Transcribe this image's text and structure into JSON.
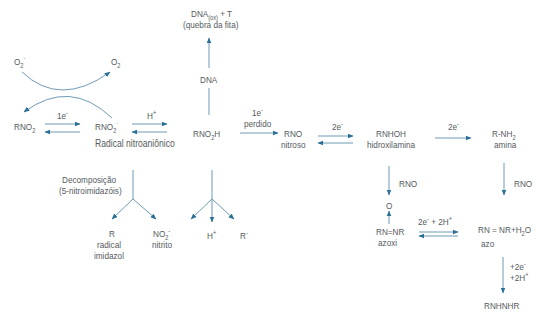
{
  "colors": {
    "arrow": "#2a6f97",
    "arrow_light": "#7fa6bd",
    "text": "#555a5e"
  },
  "species": {
    "o2_radical": "O",
    "o2_radical_sub": "2",
    "o2_radical_sup": "·",
    "o2": "O",
    "o2_sub": "2",
    "rno2": "RNO",
    "rno2_sub": "2",
    "rno2_radical": "RNO",
    "rno2_radical_sub": "2",
    "rno2_radical_sup": "·",
    "radical_label": "Radical nitroaniônico",
    "rno2h": "RNO",
    "rno2h_sub": "2",
    "rno2h_tail": "H",
    "dna": "DNA",
    "dna_ox": "DNA",
    "dna_ox_sub": "(ox)",
    "dna_ox_tail": " + T",
    "dna_break": "(quebra da fita)",
    "rno": "RNO",
    "nitroso": "nitroso",
    "rnhoh": "RNHOH",
    "hidroxilamina": "hidroxilamina",
    "rnh2": "R-NH",
    "rnh2_sub": "2",
    "amina": "amina",
    "oxygen": "O",
    "azoxi_formula": "RN=NR",
    "azoxi": "azoxi",
    "azo_formula_a": "RN = NR+H",
    "azo_formula_sub": "2",
    "azo_formula_b": "O",
    "azo": "azo",
    "rnhnhr": "RNHNHR",
    "decomp_1": "Decomposição",
    "decomp_2": "(5-nitroimidazóis)",
    "r": "R",
    "radical_imidazol_1": "radical",
    "radical_imidazol_2": "imidazol",
    "no2": "NO",
    "no2_sub": "2",
    "no2_sup": "-",
    "nitrito": "nitrito",
    "h_plus": "H",
    "h_plus_sup": "+",
    "r_minus": "R",
    "r_minus_sup": "-"
  },
  "arrow_labels": {
    "one_e": "1e",
    "one_e_sup": "-",
    "h_plus": "H",
    "h_plus_sup": "+",
    "one_e_lost": "1e",
    "one_e_lost_sup": "-",
    "lost": "perdido",
    "two_e_a": "2e",
    "two_e_a_sup": "-",
    "two_e_b": "2e",
    "two_e_b_sup": "-",
    "rno_a": "RNO",
    "rno_b": "RNO",
    "two_e_2h": "2e",
    "two_e_2h_sup": "-",
    "two_e_2h_mid": " + 2H",
    "two_e_2h_sup2": "+",
    "plus2e": "+2e",
    "plus2e_sup": "-",
    "plus2h": "+2H",
    "plus2h_sup": "+"
  }
}
